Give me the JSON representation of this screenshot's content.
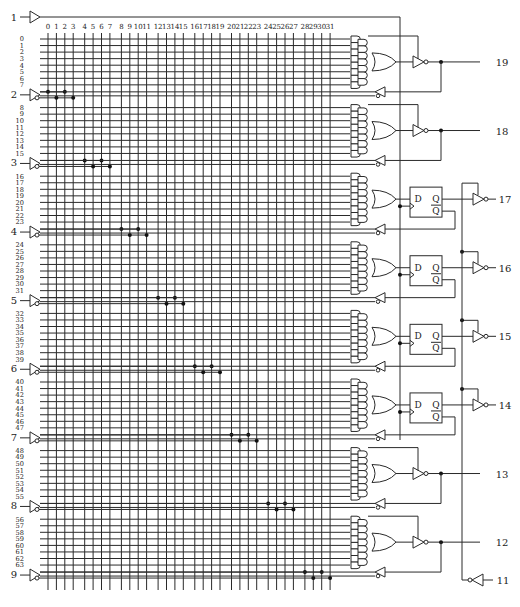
{
  "colors": {
    "line": "#2a2a2a",
    "grid": "#333333",
    "fuse_dot": "#111111",
    "background": "#ffffff"
  },
  "grid": {
    "column_labels": [
      "0",
      "1",
      "2",
      "3",
      "4",
      "5",
      "6",
      "7",
      "8",
      "9",
      "10",
      "11",
      "12",
      "13",
      "14",
      "15",
      "16",
      "17",
      "18",
      "19",
      "20",
      "21",
      "22",
      "23",
      "24",
      "25",
      "26",
      "27",
      "28",
      "29",
      "30",
      "31"
    ],
    "product_term_count": 64,
    "sections": 8,
    "rows_per_section": 8
  },
  "input_pins": [
    {
      "pin": "1",
      "role": "clock"
    },
    {
      "pin": "2"
    },
    {
      "pin": "3"
    },
    {
      "pin": "4"
    },
    {
      "pin": "5"
    },
    {
      "pin": "6"
    },
    {
      "pin": "7"
    },
    {
      "pin": "8"
    },
    {
      "pin": "9"
    },
    {
      "pin": "11",
      "role": "output-enable"
    }
  ],
  "output_pins": [
    {
      "pin": "19",
      "type": "combinatorial"
    },
    {
      "pin": "18",
      "type": "combinatorial"
    },
    {
      "pin": "17",
      "type": "registered"
    },
    {
      "pin": "16",
      "type": "registered"
    },
    {
      "pin": "15",
      "type": "registered"
    },
    {
      "pin": "14",
      "type": "registered"
    },
    {
      "pin": "13",
      "type": "combinatorial"
    },
    {
      "pin": "12",
      "type": "combinatorial"
    }
  ],
  "flip_flop": {
    "d_label": "D",
    "q_label": "Q",
    "qbar_label": "Q"
  }
}
